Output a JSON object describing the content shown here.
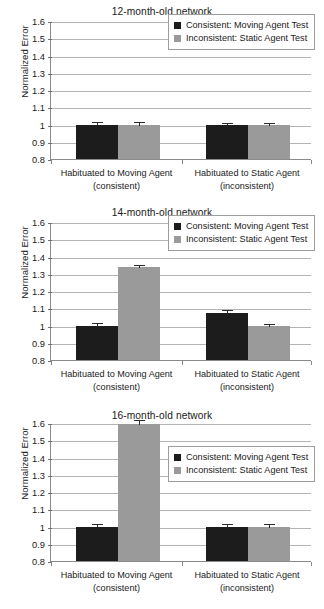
{
  "figure": {
    "panel_count": 3,
    "background_color": "#ffffff",
    "series_colors": {
      "consistent": "#1c1c1c",
      "inconsistent": "#9a9a9a"
    }
  },
  "axis": {
    "ylabel": "Normalized Error",
    "yticks": [
      "1.6",
      "1.5",
      "1.4",
      "1.3",
      "1.2",
      "1.1",
      "1",
      "0.9",
      "0.8"
    ],
    "ymin": 0.8,
    "ymax": 1.6,
    "ystep": 0.1
  },
  "legend": {
    "entries": [
      {
        "label": "Consistent: Moving Agent Test",
        "swatch": "dark"
      },
      {
        "label": "Inconsistent: Static Agent Test",
        "swatch": "light"
      }
    ]
  },
  "groups": [
    {
      "line1": "Habituated to Moving Agent",
      "line2": "(consistent)"
    },
    {
      "line1": "Habituated to Static Agent",
      "line2": "(inconsistent)"
    }
  ],
  "panels": [
    {
      "title": "12-month-old network",
      "legend_position": "upper-right-high"
    },
    {
      "title": "14-month-old network",
      "legend_position": "upper-right-high"
    },
    {
      "title": "16-month-old network",
      "legend_position": "upper-right-low"
    }
  ],
  "chart_data": [
    {
      "type": "bar",
      "title": "12-month-old network",
      "xlabel": "",
      "ylabel": "Normalized Error",
      "ylim": [
        0.8,
        1.6
      ],
      "ystep": 0.1,
      "grid": true,
      "legend_position": "upper right",
      "categories": [
        "Habituated to Moving Agent (consistent)",
        "Habituated to Static Agent (inconsistent)"
      ],
      "series": [
        {
          "name": "Consistent: Moving Agent Test",
          "color": "#1c1c1c",
          "values": [
            1.0,
            0.995
          ],
          "errors": [
            0.022,
            0.022
          ]
        },
        {
          "name": "Inconsistent: Static Agent Test",
          "color": "#9a9a9a",
          "values": [
            0.998,
            0.995
          ],
          "errors": [
            0.024,
            0.022
          ]
        }
      ]
    },
    {
      "type": "bar",
      "title": "14-month-old network",
      "xlabel": "",
      "ylabel": "Normalized Error",
      "ylim": [
        0.8,
        1.6
      ],
      "ystep": 0.1,
      "grid": true,
      "legend_position": "upper right",
      "categories": [
        "Habituated to Moving Agent (consistent)",
        "Habituated to Static Agent (inconsistent)"
      ],
      "series": [
        {
          "name": "Consistent: Moving Agent Test",
          "color": "#1c1c1c",
          "values": [
            0.998,
            1.075
          ],
          "errors": [
            0.02,
            0.02
          ]
        },
        {
          "name": "Inconsistent: Static Agent Test",
          "color": "#9a9a9a",
          "values": [
            1.34,
            0.995
          ],
          "errors": [
            0.015,
            0.022
          ]
        }
      ]
    },
    {
      "type": "bar",
      "title": "16-month-old network",
      "xlabel": "",
      "ylabel": "Normalized Error",
      "ylim": [
        0.8,
        1.6
      ],
      "ystep": 0.1,
      "grid": true,
      "legend_position": "upper right",
      "categories": [
        "Habituated to Moving Agent (consistent)",
        "Habituated to Static Agent (inconsistent)"
      ],
      "series": [
        {
          "name": "Consistent: Moving Agent Test",
          "color": "#1c1c1c",
          "values": [
            1.0,
            0.995
          ],
          "errors": [
            0.022,
            0.027
          ]
        },
        {
          "name": "Inconsistent: Static Agent Test",
          "color": "#9a9a9a",
          "values": [
            1.595,
            0.995
          ],
          "errors": [
            0.027,
            0.027
          ]
        }
      ]
    }
  ]
}
